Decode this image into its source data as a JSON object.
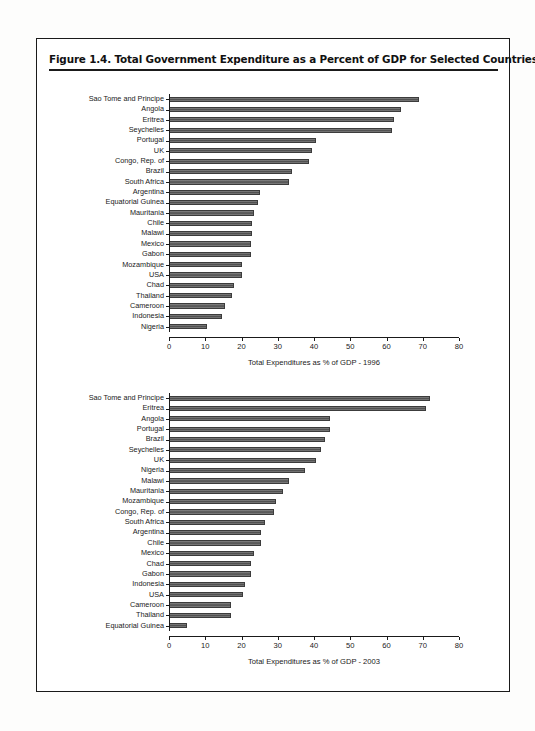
{
  "figure": {
    "title": "Figure 1.4.  Total Government Expenditure as a Percent of GDP for Selected Countries"
  },
  "chart_data": [
    {
      "type": "bar",
      "orientation": "horizontal",
      "id": "chart-1996",
      "title": "",
      "xlabel": "Total Expenditures as % of GDP - 1996",
      "ylabel": "",
      "xlim": [
        0,
        80
      ],
      "xticks": [
        0,
        10,
        20,
        30,
        40,
        50,
        60,
        70,
        80
      ],
      "ticklabels": [
        "0",
        "10",
        "20",
        "30",
        "40",
        "50",
        "60",
        "70",
        "80"
      ],
      "grid": false,
      "legend": false,
      "bar_color": "#5f5f5f",
      "categories": [
        "Sao Tome and Principe",
        "Angola",
        "Eritrea",
        "Seychelles",
        "Portugal",
        "UK",
        "Congo, Rep. of",
        "Brazil",
        "South Africa",
        "Argentina",
        "Equatorial Guinea",
        "Mauritania",
        "Chile",
        "Malawi",
        "Mexico",
        "Gabon",
        "Mozambique",
        "USA",
        "Chad",
        "Thailand",
        "Cameroon",
        "Indonesia",
        "Nigeria"
      ],
      "values": [
        69.0,
        64.0,
        62.0,
        61.5,
        40.5,
        39.5,
        38.5,
        34.0,
        33.0,
        25.0,
        24.5,
        23.5,
        23.0,
        23.0,
        22.5,
        22.5,
        20.0,
        20.0,
        18.0,
        17.5,
        15.5,
        14.5,
        10.5
      ]
    },
    {
      "type": "bar",
      "orientation": "horizontal",
      "id": "chart-2003",
      "title": "",
      "xlabel": "Total Expenditures as % of GDP - 2003",
      "ylabel": "",
      "xlim": [
        0,
        80
      ],
      "xticks": [
        0,
        10,
        20,
        30,
        40,
        50,
        60,
        70,
        80
      ],
      "ticklabels": [
        "0",
        "10",
        "20",
        "30",
        "40",
        "50",
        "60",
        "70",
        "80"
      ],
      "grid": false,
      "legend": false,
      "bar_color": "#5f5f5f",
      "categories": [
        "Sao Tome and Principe",
        "Eritrea",
        "Angola",
        "Portugal",
        "Brazil",
        "Seychelles",
        "UK",
        "Nigeria",
        "Malawi",
        "Mauritania",
        "Mozambique",
        "Congo, Rep. of",
        "South Africa",
        "Argentina",
        "Chile",
        "Mexico",
        "Chad",
        "Gabon",
        "Indonesia",
        "USA",
        "Cameroon",
        "Thailand",
        "Equatorial Guinea"
      ],
      "values": [
        72.0,
        71.0,
        44.5,
        44.5,
        43.0,
        42.0,
        40.5,
        37.5,
        33.0,
        31.5,
        29.5,
        29.0,
        26.5,
        25.5,
        25.5,
        23.5,
        22.5,
        22.5,
        21.0,
        20.5,
        17.0,
        17.0,
        5.0
      ]
    }
  ]
}
